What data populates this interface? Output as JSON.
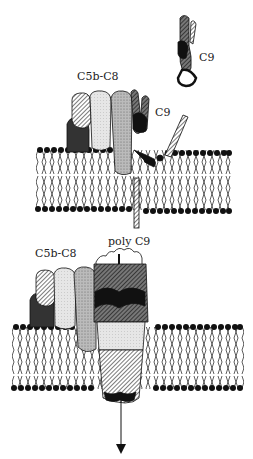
{
  "diagram": {
    "top_panel": {
      "labels": {
        "free_c9": "C9",
        "complex": "C5b-C8",
        "bound_c9": "C9"
      }
    },
    "bottom_panel": {
      "labels": {
        "complex": "C5b-C8",
        "pore": "poly C9"
      }
    }
  }
}
